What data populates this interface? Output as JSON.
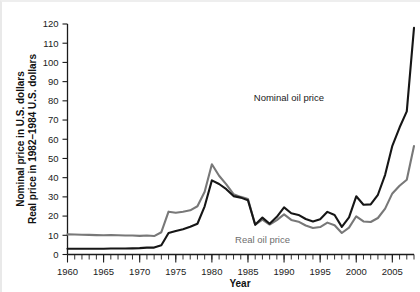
{
  "chart_data": {
    "type": "line",
    "title": "",
    "xlabel": "Year",
    "ylabel_lines": [
      "Nominal price in U.S. dollars",
      "Real price in 1982–1984 U.S. dollars"
    ],
    "grid": false,
    "legend_position": "inline-annotations",
    "xlim": [
      1960,
      2008
    ],
    "ylim": [
      0,
      120
    ],
    "ytick_values": [
      0,
      10,
      20,
      30,
      40,
      50,
      60,
      70,
      80,
      90,
      100,
      110,
      120
    ],
    "ytick_labels": [
      "0",
      "10",
      "20",
      "30",
      "40",
      "50",
      "60",
      "70",
      "80",
      "90",
      "100",
      "110",
      "120"
    ],
    "xtick_labels": [
      "1960",
      "1965",
      "1970",
      "1975",
      "1980",
      "1985",
      "1990",
      "1995",
      "2000",
      "2005"
    ],
    "xtick_values": [
      1960,
      1965,
      1970,
      1975,
      1980,
      1985,
      1990,
      1995,
      2000,
      2005
    ],
    "x_minor_tick_step": 1,
    "x": [
      1960,
      1961,
      1962,
      1963,
      1964,
      1965,
      1966,
      1967,
      1968,
      1969,
      1970,
      1971,
      1972,
      1973,
      1974,
      1975,
      1976,
      1977,
      1978,
      1979,
      1980,
      1981,
      1982,
      1983,
      1984,
      1985,
      1986,
      1987,
      1988,
      1989,
      1990,
      1991,
      1992,
      1993,
      1994,
      1995,
      1996,
      1997,
      1998,
      1999,
      2000,
      2001,
      2002,
      2003,
      2004,
      2005,
      2006,
      2007,
      2008
    ],
    "series": [
      {
        "name": "Nominal oil price",
        "color": "#161616",
        "values": [
          3.0,
          3.0,
          3.0,
          3.0,
          3.0,
          3.0,
          3.1,
          3.1,
          3.1,
          3.2,
          3.3,
          3.6,
          3.6,
          4.8,
          11.2,
          12.2,
          13.1,
          14.4,
          16.0,
          25.1,
          38.6,
          36.7,
          34.0,
          30.4,
          29.6,
          28.2,
          15.5,
          19.2,
          16.0,
          19.6,
          24.5,
          21.5,
          20.6,
          18.5,
          17.2,
          18.4,
          22.2,
          20.6,
          14.4,
          19.3,
          30.3,
          25.9,
          26.1,
          31.1,
          41.5,
          56.6,
          66.1,
          74.5,
          118.0
        ]
      },
      {
        "name": "Real oil price",
        "color": "#787878",
        "values": [
          10.5,
          10.4,
          10.3,
          10.2,
          10.1,
          10.0,
          10.1,
          10.0,
          9.9,
          9.9,
          9.7,
          9.9,
          9.6,
          11.6,
          22.3,
          21.7,
          22.3,
          23.0,
          25.1,
          32.7,
          47.0,
          41.0,
          36.5,
          31.4,
          30.0,
          28.9,
          15.5,
          18.2,
          15.6,
          17.9,
          20.9,
          18.0,
          17.1,
          15.1,
          13.8,
          14.3,
          16.6,
          15.2,
          11.2,
          14.0,
          19.9,
          17.2,
          16.9,
          19.0,
          23.9,
          31.8,
          35.8,
          38.9,
          56.5
        ]
      }
    ],
    "annotations": [
      {
        "text": "Nominal oil price",
        "series": "Nominal oil price",
        "x": 322,
        "y": 99
      },
      {
        "text": "Real oil price",
        "series": "Real oil price",
        "x": 288,
        "y": 241
      }
    ]
  }
}
